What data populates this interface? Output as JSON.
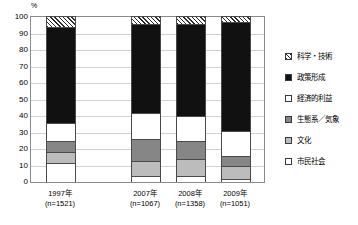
{
  "chart_data": {
    "type": "bar",
    "stacked": true,
    "title": "",
    "xlabel": "",
    "ylabel": "%",
    "ylim": [
      0,
      100
    ],
    "ytick_step": 10,
    "yticks": [
      "100",
      "90",
      "80",
      "70",
      "60",
      "50",
      "40",
      "30",
      "20",
      "10",
      "0"
    ],
    "grid": true,
    "legend_position": "right",
    "categories": [
      "1997年",
      "2007年",
      "2008年",
      "2009年"
    ],
    "category_sublabels": [
      "(n=1521)",
      "(n=1067)",
      "(n=1358)",
      "(n=1051)"
    ],
    "series": [
      {
        "name": "市民社会",
        "pattern": "white",
        "values": [
          11.5,
          3.5,
          3.5,
          2.0
        ]
      },
      {
        "name": "文化",
        "pattern": "medgray",
        "values": [
          6.5,
          9.5,
          10.5,
          8.0
        ]
      },
      {
        "name": "生態系／気象",
        "pattern": "darkgray",
        "values": [
          7.0,
          13.0,
          11.0,
          6.0
        ]
      },
      {
        "name": "経済的利益",
        "pattern": "dots",
        "values": [
          11.0,
          16.0,
          15.0,
          15.0
        ]
      },
      {
        "name": "政策形成",
        "pattern": "black",
        "values": [
          58.0,
          54.0,
          56.0,
          66.0
        ]
      },
      {
        "name": "科学・技術",
        "pattern": "hatch",
        "values": [
          6.0,
          4.0,
          4.0,
          3.0
        ]
      }
    ]
  },
  "legend": {
    "items": [
      {
        "label": "科学・技術",
        "pattern": "hatch"
      },
      {
        "label": "政策形成",
        "pattern": "black"
      },
      {
        "label": "経済的利益",
        "pattern": "dots"
      },
      {
        "label": "生態系／気象",
        "pattern": "darkgray"
      },
      {
        "label": "文化",
        "pattern": "medgray"
      },
      {
        "label": "市民社会",
        "pattern": "white"
      }
    ]
  },
  "axis": {
    "y_unit": "%"
  },
  "footnote": ""
}
